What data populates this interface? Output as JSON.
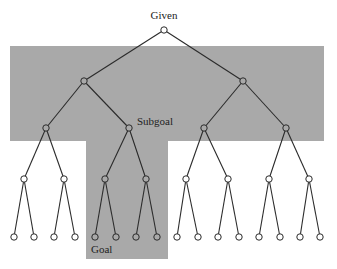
{
  "figure": {
    "labels": {
      "root": "Given",
      "subgoal": "Subgoal",
      "goal": "Goal"
    },
    "colors": {
      "shaded_region": "#a9a9a9",
      "background": "#ffffff",
      "line": "#2b2b2b",
      "node_fill_outside": "#ffffff",
      "node_fill_inside": "#a9a9a9"
    },
    "structure": {
      "type": "complete binary tree",
      "depth": 5,
      "leaf_count": 16,
      "shaded_region": "T-shaped: levels 1-2 across full width, subtree under Subgoal down to leaves",
      "subgoal_node": "level 2, second from left",
      "goal_node": "leaf 5 (first leaf under Subgoal)"
    }
  }
}
